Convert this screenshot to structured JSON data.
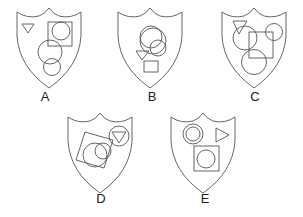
{
  "figure": {
    "stroke_color": "#555555",
    "options": [
      {
        "label": "A",
        "shapes": [
          "triangle",
          "square",
          "circle",
          "circle",
          "circle"
        ]
      },
      {
        "label": "B",
        "shapes": [
          "circle",
          "circle",
          "circle",
          "triangle",
          "square"
        ]
      },
      {
        "label": "C",
        "shapes": [
          "triangle",
          "circle",
          "square",
          "circle",
          "circle"
        ]
      },
      {
        "label": "D",
        "shapes": [
          "square",
          "circle",
          "circle",
          "circle",
          "triangle"
        ]
      },
      {
        "label": "E",
        "shapes": [
          "circle",
          "circle",
          "triangle",
          "square",
          "circle"
        ]
      }
    ]
  }
}
